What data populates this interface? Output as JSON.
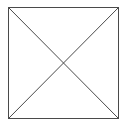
{
  "diagram": {
    "shape": "square-with-diagonals",
    "square": {
      "x": 8,
      "y": 7,
      "width": 110,
      "height": 111
    },
    "diagonals": [
      {
        "x1": 8,
        "y1": 7,
        "x2": 118,
        "y2": 118
      },
      {
        "x1": 118,
        "y1": 7,
        "x2": 8,
        "y2": 118
      }
    ],
    "stroke_color": "#4a4a4a",
    "background_color": "#ffffff"
  }
}
